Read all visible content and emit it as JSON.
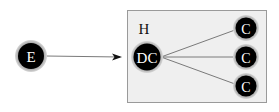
{
  "diagram": {
    "group": {
      "label": "H",
      "x": 127,
      "y": 10,
      "width": 140,
      "height": 93,
      "fill": "#efefef",
      "stroke": "#9a9a9a"
    },
    "nodes": [
      {
        "id": "E",
        "label": "E",
        "cx": 31,
        "cy": 56,
        "r": 14,
        "font_size": 15
      },
      {
        "id": "DC",
        "label": "DC",
        "cx": 147,
        "cy": 57,
        "r": 14,
        "font_size": 15
      },
      {
        "id": "C1",
        "label": "C",
        "cx": 246,
        "cy": 28,
        "r": 11,
        "font_size": 14
      },
      {
        "id": "C2",
        "label": "C",
        "cx": 246,
        "cy": 57,
        "r": 11,
        "font_size": 14
      },
      {
        "id": "C3",
        "label": "C",
        "cx": 246,
        "cy": 86,
        "r": 11,
        "font_size": 14
      }
    ],
    "edges": [
      {
        "from": "E",
        "to": "DC",
        "directed": true
      },
      {
        "from": "DC",
        "to": "C1",
        "directed": false
      },
      {
        "from": "DC",
        "to": "C2",
        "directed": false
      },
      {
        "from": "DC",
        "to": "C3",
        "directed": false
      }
    ],
    "colors": {
      "node_fill": "#000000",
      "node_ring": "#8c8c8c",
      "node_text": "#ffffff",
      "edge": "#7a7a7a",
      "arrow": "#111111"
    }
  }
}
